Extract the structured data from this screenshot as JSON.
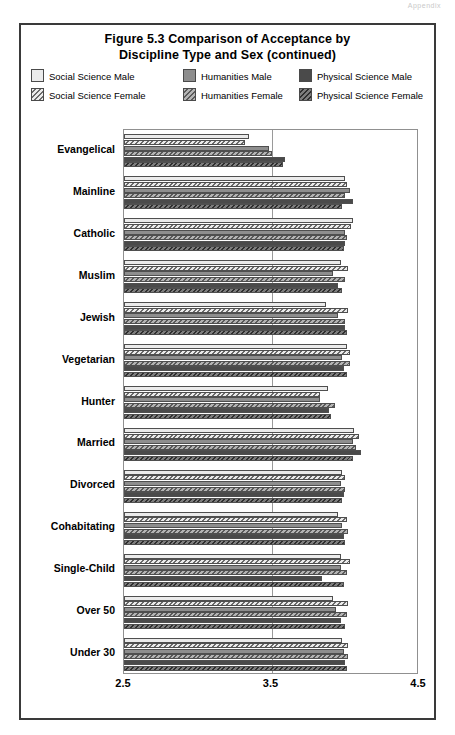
{
  "page_header": "Appendix",
  "figure": {
    "title_line1": "Figure 5.3 Comparison of Acceptance by",
    "title_line2": "Discipline Type and Sex (continued)"
  },
  "legend": {
    "items": [
      {
        "label": "Social Science Male",
        "key": "ssm",
        "swatch": "solid-light-swatch",
        "color": "#ebebeb"
      },
      {
        "label": "Humanities Male",
        "key": "hm",
        "swatch": "solid-mid-swatch",
        "color": "#8e8e8e"
      },
      {
        "label": "Physical Science Male",
        "key": "psm",
        "swatch": "solid-dark-swatch",
        "color": "#4a4a4a"
      },
      {
        "label": "Social Science Female",
        "key": "ssf",
        "swatch": "hatched-light-swatch",
        "color": "#ebebeb"
      },
      {
        "label": "Humanities Female",
        "key": "hf",
        "swatch": "hatched-mid-swatch",
        "color": "#9a9a9a"
      },
      {
        "label": "Physical Science Female",
        "key": "pf",
        "swatch": "hatched-dark-swatch",
        "color": "#585858"
      }
    ]
  },
  "chart_data": {
    "type": "bar",
    "orientation": "horizontal",
    "title": "Figure 5.3 Comparison of Acceptance by Discipline Type and Sex (continued)",
    "xlabel": "",
    "ylabel": "",
    "xlim": [
      2.5,
      4.5
    ],
    "xticks": [
      2.5,
      3.5,
      4.5
    ],
    "xtick_labels": [
      "2.5",
      "3.5",
      "4.5"
    ],
    "grid": "single vertical gridline at 3.5",
    "legend_position": "top",
    "categories": [
      "Evangelical",
      "Mainline",
      "Catholic",
      "Muslim",
      "Jewish",
      "Vegetarian",
      "Hunter",
      "Married",
      "Divorced",
      "Cohabitating",
      "Single-Child",
      "Over 50",
      "Under 30"
    ],
    "series": [
      {
        "name": "Social Science Male",
        "key": "ssm",
        "values": [
          3.35,
          4.0,
          4.05,
          3.97,
          3.87,
          4.01,
          3.88,
          4.06,
          3.98,
          3.95,
          3.97,
          3.92,
          3.98
        ]
      },
      {
        "name": "Social Science Female",
        "key": "ssf",
        "values": [
          3.32,
          4.01,
          4.04,
          4.02,
          4.02,
          4.03,
          3.83,
          4.09,
          4.0,
          4.01,
          4.03,
          4.02,
          4.02
        ]
      },
      {
        "name": "Humanities Male",
        "key": "hm",
        "values": [
          3.48,
          4.03,
          4.0,
          3.92,
          3.95,
          3.98,
          3.83,
          4.05,
          3.97,
          3.98,
          3.97,
          3.94,
          3.99
        ]
      },
      {
        "name": "Humanities Female",
        "key": "hf",
        "values": [
          3.5,
          4.0,
          4.01,
          4.0,
          4.0,
          4.03,
          3.93,
          4.07,
          4.0,
          4.02,
          4.01,
          4.01,
          4.02
        ]
      },
      {
        "name": "Physical Science Male",
        "key": "psm",
        "values": [
          3.59,
          4.05,
          4.0,
          3.95,
          4.0,
          3.99,
          3.89,
          4.11,
          3.99,
          3.99,
          3.84,
          3.97,
          4.0
        ]
      },
      {
        "name": "Physical Science Female",
        "key": "pf",
        "values": [
          3.58,
          3.98,
          3.99,
          3.98,
          4.01,
          4.01,
          3.9,
          4.05,
          3.98,
          4.0,
          3.99,
          4.0,
          4.01
        ]
      }
    ]
  }
}
